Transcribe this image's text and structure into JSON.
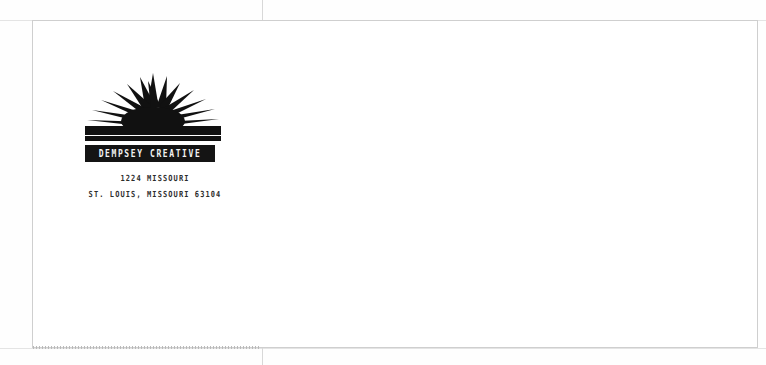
{
  "document": {
    "type": "envelope-mockup",
    "background_color": "#fefefe",
    "paper_color": "#ffffff",
    "border_color": "#cfcfcf",
    "ink_color": "#111111"
  },
  "guides": {
    "vertical_center_label": "vertical-center-guide",
    "top_edge_label": "top-edge-guide",
    "bottom_edge_label": "bottom-edge-guide"
  },
  "logo": {
    "icon_name": "sunburst-icon",
    "ray_count": 14,
    "rule_label": "logo-rule",
    "wordmark": "DEMPSEY CREATIVE",
    "wordmark_bar_color": "#141414",
    "wordmark_text_color": "#f2f2f2"
  },
  "address": {
    "line1": "1224 MISSOURI",
    "line2": "ST. LOUIS, MISSOURI 63104"
  }
}
